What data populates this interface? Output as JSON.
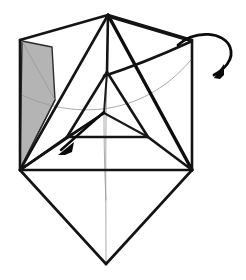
{
  "figure": {
    "title": "Origami folding step diagram",
    "kind": "line-drawing",
    "background_color": "#ffffff",
    "ink_color": "#141414",
    "shaded_face_color": "#b4b4b4",
    "crease_color": "#9a9a9a",
    "canvas": {
      "width": 246,
      "height": 280
    }
  },
  "vertices": {
    "top_apex": {
      "x": 108,
      "y": 15
    },
    "upper_left_corner": {
      "x": 20,
      "y": 40
    },
    "upper_right_corner": {
      "x": 192,
      "y": 40
    },
    "left_vertex": {
      "x": 20,
      "y": 170
    },
    "right_vertex": {
      "x": 192,
      "y": 170
    },
    "bottom_vertex": {
      "x": 106,
      "y": 264
    },
    "inner_top": {
      "x": 107,
      "y": 72
    },
    "inner_left": {
      "x": 67,
      "y": 137
    },
    "inner_right": {
      "x": 148,
      "y": 137
    },
    "inner_center": {
      "x": 104,
      "y": 113
    },
    "fold_notch": {
      "x": 52,
      "y": 44
    }
  },
  "outline": {
    "name": "outer-silhouette",
    "points": "108,15 192,40 192,170 106,264 20,170 20,40"
  },
  "shaded_face": {
    "name": "gray-flap",
    "fill": "#b4b4b4",
    "points": "22,41 52,47 55,100 20,169"
  },
  "shaded_face_fold": {
    "name": "flap-fold-line",
    "path": "M 22,41 L 55,100"
  },
  "heavy_edges": [
    {
      "name": "edge-apex-to-upper-right",
      "path": "M 108,15 L 192,40"
    },
    {
      "name": "edge-upper-right-to-right-vertex",
      "path": "M 192,40 L 192,170"
    },
    {
      "name": "edge-right-vertex-to-bottom",
      "path": "M 192,170 L 106,264"
    },
    {
      "name": "edge-bottom-to-left-vertex",
      "path": "M 106,264 L 20,170"
    },
    {
      "name": "edge-left-vertex-to-upper-left",
      "path": "M 20,170 L 20,40"
    },
    {
      "name": "edge-upper-left-to-apex",
      "path": "M 20,40 L 108,15"
    },
    {
      "name": "edge-left-vertex-to-right-vertex",
      "path": "M 20,170 L 192,170"
    },
    {
      "name": "edge-apex-to-right-vertex",
      "path": "M 108,15 L 192,170"
    },
    {
      "name": "edge-apex-to-left-vertex",
      "path": "M 108,15 L 20,170"
    },
    {
      "name": "edge-apex-to-inner-top",
      "path": "M 108,15 L 107,72"
    },
    {
      "name": "edge-inner-top-to-inner-left",
      "path": "M 107,72 L 67,137"
    },
    {
      "name": "edge-inner-top-to-inner-right",
      "path": "M 107,72 L 148,137"
    },
    {
      "name": "edge-inner-left-to-inner-right",
      "path": "M 67,137 L 148,137"
    },
    {
      "name": "edge-inner-center-to-left-vertex",
      "path": "M 104,113 L 20,170"
    },
    {
      "name": "edge-inner-center-to-inner-top",
      "path": "M 104,113 L 107,72"
    },
    {
      "name": "edge-inner-center-to-inner-left",
      "path": "M 104,113 L 67,137"
    },
    {
      "name": "edge-inner-center-to-inner-right",
      "path": "M 104,113 L 148,137"
    },
    {
      "name": "edge-inner-left-to-left-vertex",
      "path": "M 67,137 L 20,170"
    },
    {
      "name": "edge-inner-right-to-right-vertex",
      "path": "M 148,137 L 192,170"
    },
    {
      "name": "edge-band-upper-to-upper-right",
      "path": "M 110,17 L 191,41"
    },
    {
      "name": "edge-band-lower-to-inner-top",
      "path": "M 104,76 L 190,42"
    }
  ],
  "thin_edges": [
    {
      "name": "crease-left-vertex-to-upper-left-inner",
      "path": "M 20,169 L 55,100"
    },
    {
      "name": "crease-left-vertex-to-inner-left-low",
      "path": "M 20,169 L 66,138"
    }
  ],
  "faint_creases": [
    {
      "name": "crease-arc-horizontal",
      "path": "M 22,95 C 70,118 140,120 191,60"
    },
    {
      "name": "crease-vertical-center",
      "path": "M 107,73 C 105,140 106,210 106,262"
    },
    {
      "name": "crease-inner-center-to-bottom",
      "path": "M 104,113 C 104,150 105,180 106,200"
    },
    {
      "name": "crease-inner-top-to-upper-right",
      "path": "M 108,74 C 140,66 170,52 190,42"
    }
  ],
  "arrows": [
    {
      "name": "fold-direction-arrow",
      "kind": "straight",
      "body": "M 104,112 L 61,150",
      "head": "58,155 74,142 72,152 65,155",
      "description": "straight arrow pointing down-left"
    },
    {
      "name": "rotate-hook-arrow",
      "kind": "curved-hook",
      "body": "M 178,45 C 196,29 224,32 230,47 C 235,60 223,70 214,75",
      "head": "214,78 224,64 224,75 220,79",
      "description": "curved hook arrow looping over top-right corner"
    }
  ],
  "labels": []
}
